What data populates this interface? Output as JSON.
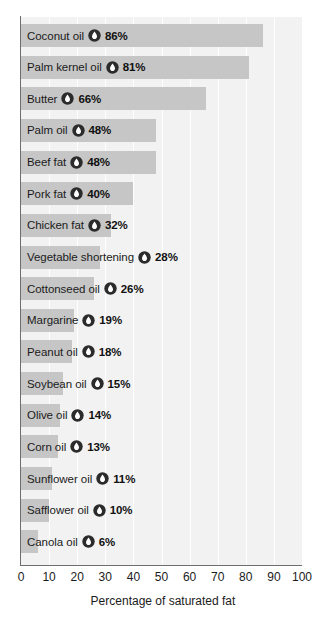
{
  "chart_data": {
    "type": "bar",
    "orientation": "horizontal",
    "title": "",
    "xlabel": "Percentage of saturated fat",
    "ylabel": "",
    "xlim": [
      0,
      100
    ],
    "xticks": [
      0,
      10,
      20,
      30,
      40,
      50,
      60,
      70,
      80,
      90,
      100
    ],
    "grid": true,
    "grid_axis": "x",
    "legend": "none",
    "value_suffix": "%",
    "marker_icon": "droplet-icon",
    "categories": [
      "Coconut oil",
      "Palm kernel oil",
      "Butter",
      "Palm oil",
      "Beef fat",
      "Pork fat",
      "Chicken fat",
      "Vegetable shortening",
      "Cottonseed oil",
      "Margarine",
      "Peanut oil",
      "Soybean oil",
      "Olive oil",
      "Corn oil",
      "Sunflower oil",
      "Safflower oil",
      "Canola oil"
    ],
    "values": [
      86,
      81,
      66,
      48,
      48,
      40,
      32,
      28,
      26,
      19,
      18,
      15,
      14,
      13,
      11,
      10,
      6
    ],
    "value_labels": [
      "86%",
      "81%",
      "66%",
      "48%",
      "48%",
      "40%",
      "32%",
      "28%",
      "26%",
      "19%",
      "18%",
      "15%",
      "14%",
      "13%",
      "11%",
      "10%",
      "6%"
    ],
    "tick_labels": [
      "0",
      "10",
      "20",
      "30",
      "40",
      "50",
      "60",
      "70",
      "80",
      "90",
      "100"
    ],
    "colors": {
      "bar": "#c6c6c6",
      "plot_background": "#f2f2f2",
      "gridline": "#ffffff",
      "axis": "#6e6e6e",
      "text": "#1b1b1b",
      "marker_fill": "#2b2b2b",
      "marker_drop": "#ffffff"
    }
  }
}
